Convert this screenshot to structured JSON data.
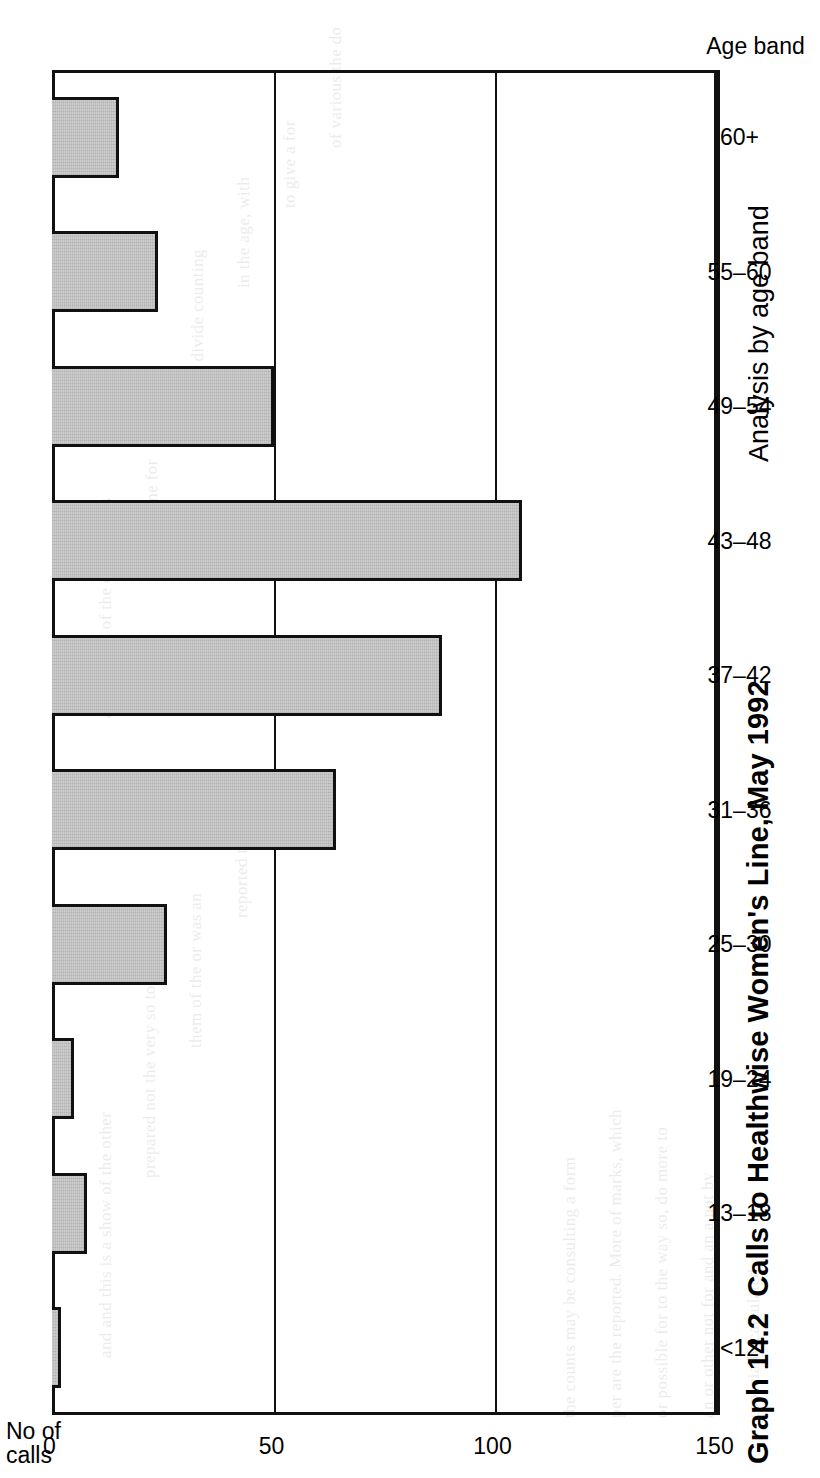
{
  "caption": {
    "figure_number": "Graph 14.2",
    "title": "Calls to Healthwise Women's Line, May 1992",
    "subtitle": "Analysis by age band"
  },
  "axes": {
    "value_axis_title_line1": "No of",
    "value_axis_title_line2": "calls",
    "category_axis_title": "Age band"
  },
  "chart_data": {
    "type": "bar",
    "orientation": "horizontal-on-rotated-page",
    "subtitle": "Analysis by age band",
    "xlabel": "Age band",
    "ylabel": "No of calls",
    "ylim": [
      0,
      150
    ],
    "yticks": [
      0,
      50,
      100,
      150
    ],
    "ytick_labels": [
      "0",
      "50",
      "100",
      "150"
    ],
    "grid": true,
    "legend": null,
    "categories": [
      "<12",
      "13–18",
      "19–24",
      "25–30",
      "31–36",
      "37–42",
      "43–48",
      "49–54",
      "55–60",
      "60+"
    ],
    "values": [
      2,
      8,
      5,
      26,
      64,
      88,
      106,
      50,
      24,
      15
    ],
    "bar_fill_color": "#c6c6c6",
    "bar_edge_color": "#111111"
  },
  "ghost_text": [
    "and and this is a show of the other",
    "prepared not the very so to",
    "them of the or was an",
    "reported the time",
    "and the sort of the other things",
    "to a time for",
    "with divide counting",
    "in the age, with",
    "to give a for",
    "of various the do",
    "the counts may be consulting a form",
    "per are the reported. More of marks, which",
    "or possible for to the way so, do more to",
    "an or other not for and an a not by",
    "especially calculated"
  ]
}
